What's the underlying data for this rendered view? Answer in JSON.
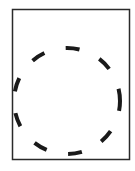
{
  "diagram": {
    "frame": {
      "x": 12.5,
      "y": 9.5,
      "width": 117,
      "height": 150,
      "stroke": "#2a2a2a",
      "stroke_width": 1.5
    },
    "circle": {
      "cx": 67,
      "cy": 101,
      "r": 53,
      "stroke": "#1a1a1a",
      "stroke_width": 4,
      "dash": "14 22",
      "dash_offset": 4
    }
  }
}
